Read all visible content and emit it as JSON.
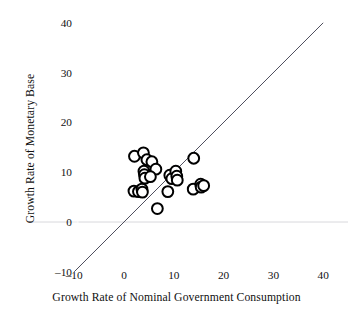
{
  "chart_data": {
    "type": "scatter",
    "title": "",
    "xlabel": "Growth Rate of Nominal Government Consumption",
    "ylabel": "Growth Rate of Monetary Base",
    "xlim": [
      -10,
      40
    ],
    "ylim": [
      -10,
      40
    ],
    "xticks": [
      -10,
      0,
      10,
      20,
      30,
      40
    ],
    "yticks": [
      -10,
      0,
      10,
      20,
      30,
      40
    ],
    "xtick_labels": [
      "–10",
      "0",
      "10",
      "20",
      "30",
      "40"
    ],
    "ytick_labels": [
      "–10",
      "0",
      "10",
      "20",
      "30",
      "40"
    ],
    "grid": false,
    "legend": null,
    "marker": {
      "shape": "open-circle",
      "edge_color": "#000000",
      "face_color": "#ffffff",
      "size": 5.4,
      "edge_width": 2.0
    },
    "reference_line": {
      "name": "45-degree-line",
      "equation": "y = x",
      "from": [
        -10,
        -10
      ],
      "to": [
        40,
        40
      ],
      "color": "#3a3a4a",
      "width": 0.9
    },
    "zero_line": {
      "name": "y-zero-line",
      "value": 0,
      "color": "#d8d8dc",
      "width": 1
    },
    "points": [
      {
        "x": 2.1,
        "y": 13.2
      },
      {
        "x": 3.9,
        "y": 13.9
      },
      {
        "x": 4.6,
        "y": 12.5
      },
      {
        "x": 5.6,
        "y": 12.1
      },
      {
        "x": 4.0,
        "y": 10.2
      },
      {
        "x": 4.1,
        "y": 9.5
      },
      {
        "x": 4.2,
        "y": 8.8
      },
      {
        "x": 6.4,
        "y": 10.6
      },
      {
        "x": 5.3,
        "y": 9.1
      },
      {
        "x": 2.0,
        "y": 6.2
      },
      {
        "x": 2.9,
        "y": 6.1
      },
      {
        "x": 3.6,
        "y": 6.6
      },
      {
        "x": 3.7,
        "y": 6.0
      },
      {
        "x": 6.7,
        "y": 2.7
      },
      {
        "x": 9.2,
        "y": 9.4
      },
      {
        "x": 9.6,
        "y": 8.7
      },
      {
        "x": 10.4,
        "y": 10.2
      },
      {
        "x": 10.6,
        "y": 9.2
      },
      {
        "x": 10.7,
        "y": 8.4
      },
      {
        "x": 8.8,
        "y": 6.1
      },
      {
        "x": 14.0,
        "y": 12.8
      },
      {
        "x": 13.9,
        "y": 6.6
      },
      {
        "x": 15.4,
        "y": 7.6
      },
      {
        "x": 15.5,
        "y": 7.0
      },
      {
        "x": 16.0,
        "y": 7.3
      }
    ]
  }
}
